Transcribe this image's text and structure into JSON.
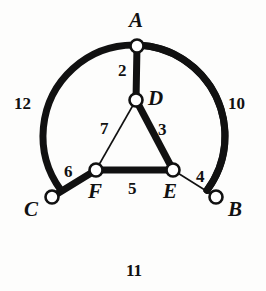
{
  "figure": {
    "background_color": "#fdfdfc",
    "ink_color": "#111111"
  },
  "chart_data": {
    "type": "diagram",
    "title": "",
    "xlabel": "",
    "ylabel": "",
    "nodes": [
      {
        "id": "A",
        "label": "A",
        "x": 137,
        "y": 46,
        "label_x": 129,
        "label_y": 10,
        "on_circle": true
      },
      {
        "id": "B",
        "label": "B",
        "x": 216,
        "y": 197,
        "label_x": 228,
        "label_y": 199,
        "on_circle": true
      },
      {
        "id": "C",
        "label": "C",
        "x": 52,
        "y": 197,
        "label_x": 24,
        "label_y": 199,
        "on_circle": true
      },
      {
        "id": "D",
        "label": "D",
        "x": 136,
        "y": 100,
        "label_x": 148,
        "label_y": 88,
        "on_circle": false
      },
      {
        "id": "E",
        "label": "E",
        "x": 173,
        "y": 170,
        "label_x": 163,
        "label_y": 181,
        "on_circle": false
      },
      {
        "id": "F",
        "label": "F",
        "x": 96,
        "y": 170,
        "label_x": 88,
        "label_y": 181,
        "on_circle": false
      }
    ],
    "edges": [
      {
        "id": "AD",
        "from": "A",
        "to": "D",
        "weight": 2,
        "kind": "line",
        "thick": true,
        "label_x": 118,
        "label_y": 62
      },
      {
        "id": "DE",
        "from": "D",
        "to": "E",
        "weight": 3,
        "kind": "line",
        "thick": true,
        "label_x": 158,
        "label_y": 121
      },
      {
        "id": "EB",
        "from": "E",
        "to": "B",
        "weight": 4,
        "kind": "line",
        "thick": false,
        "label_x": 196,
        "label_y": 168
      },
      {
        "id": "FE",
        "from": "F",
        "to": "E",
        "weight": 5,
        "kind": "line",
        "thick": true,
        "label_x": 128,
        "label_y": 180
      },
      {
        "id": "CF",
        "from": "C",
        "to": "F",
        "weight": 6,
        "kind": "line",
        "thick": true,
        "label_x": 64,
        "label_y": 163
      },
      {
        "id": "DF",
        "from": "D",
        "to": "F",
        "weight": 7,
        "kind": "line",
        "thick": false,
        "label_x": 100,
        "label_y": 120
      },
      {
        "id": "AB",
        "from": "A",
        "to": "B",
        "weight": 10,
        "kind": "arc",
        "thick": true,
        "label_x": 228,
        "label_y": 95
      },
      {
        "id": "CB",
        "from": "C",
        "to": "B",
        "weight": 11,
        "kind": "arc",
        "thick": true,
        "label_x": 126,
        "label_y": 262
      },
      {
        "id": "CA",
        "from": "C",
        "to": "A",
        "weight": 12,
        "kind": "arc",
        "thick": false,
        "label_x": 14,
        "label_y": 95
      }
    ],
    "circle": {
      "cx": 134,
      "cy": 136,
      "r": 91
    },
    "stroke_widths": {
      "thin": 1.6,
      "thick": 7
    },
    "vertex_marker": {
      "radius": 6.5,
      "fill": "#ffffff",
      "stroke": "#111111",
      "stroke_width": 2.6
    }
  }
}
